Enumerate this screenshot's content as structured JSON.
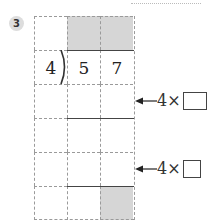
{
  "problem": {
    "number": "3",
    "divisor": "4",
    "dividend_digits": [
      "5",
      "7"
    ],
    "hints": [
      {
        "multiplier_text": "4×",
        "answer": ""
      },
      {
        "multiplier_text": "4×",
        "answer": ""
      }
    ]
  },
  "colors": {
    "shade": "#d6d6d6",
    "grid_line": "#9a9a9a",
    "badge": "#dddddd"
  }
}
